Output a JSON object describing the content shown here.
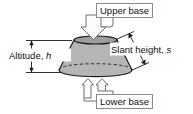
{
  "figure": {
    "shape": "frustum",
    "background_color": "#ffffff",
    "body_fill": "#b5b5b5",
    "top_face_fill": "#a0a0a0",
    "outline_color": "#1a1a1a",
    "callout_border_color": "#8a8a8a",
    "hidden_edge_style": "dashed"
  },
  "labels": {
    "upper_base": "Upper base",
    "lower_base": "Lower base",
    "altitude_text": "Altitude, ",
    "altitude_symbol": "h",
    "slant_text": "Slant height, ",
    "slant_symbol": "s"
  },
  "annotations": {
    "altitude_dimension": "vertical double-headed arrow between upper and lower base levels",
    "slant_dimension": "diagonal double-headed arrow along the slant side",
    "upper_base_pointer": "block arrow pointing down onto the top face",
    "lower_base_pointer": "two block arrows pointing up onto the bottom face"
  }
}
